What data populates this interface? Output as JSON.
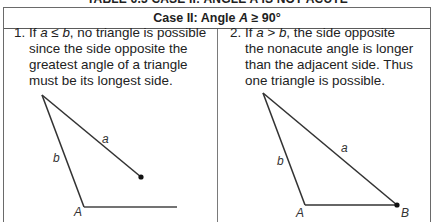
{
  "page": {
    "top_title": "TABLE 6.3 CASE II: ANGLE A IS NOT ACUTE"
  },
  "table": {
    "header": {
      "prefix": "Case II: Angle ",
      "var": "A",
      "suffix": " ≥ 90°"
    },
    "cells": [
      {
        "number": "1.",
        "lead": "If ",
        "condition": "a ≤ b",
        "text": ", no triangle is possible\nsince the side opposite the\ngreatest angle of a triangle\nmust be its longest side.",
        "figure": {
          "labels": {
            "a": "a",
            "b": "b",
            "A": "A"
          },
          "description": "No triangle: side a too short to reach base"
        }
      },
      {
        "number": "2.",
        "lead": "If ",
        "condition": "a > b",
        "text": ", the side opposite\nthe nonacute angle is longer\nthan the adjacent side. Thus\none triangle is possible.",
        "figure": {
          "labels": {
            "a": "a",
            "b": "b",
            "A": "A",
            "B": "B"
          },
          "description": "One triangle: side a reaches base at B"
        }
      }
    ]
  },
  "colors": {
    "line": "#333333",
    "border": "#6a6a6a",
    "text": "#222222"
  }
}
